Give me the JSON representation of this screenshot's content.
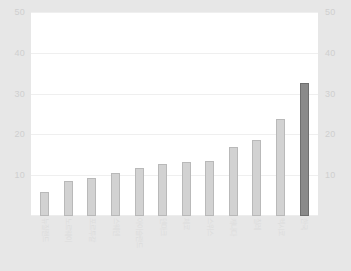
{
  "chart_data": {
    "type": "bar",
    "title": "",
    "xlabel": "",
    "ylabel": "",
    "ylim": [
      0,
      50
    ],
    "grid": true,
    "legend": "none",
    "y_ticks": [
      "10",
      "20",
      "30",
      "40",
      "50"
    ],
    "y_ticks_right": [
      "10",
      "20",
      "30",
      "40",
      "50"
    ],
    "categories": [
      "뉴질랜드",
      "노르웨이",
      "포르투갈",
      "스웨덴",
      "아이슬란드",
      "덴마크",
      "체코",
      "스위스",
      "캐나다",
      "칠레",
      "멕시코",
      "한국"
    ],
    "values": [
      6.0,
      8.5,
      9.3,
      10.5,
      11.8,
      12.7,
      13.3,
      13.5,
      17.0,
      18.7,
      23.8,
      32.5
    ],
    "highlight_index": 11,
    "colors": {
      "bar": "#d2d2d2",
      "bar_border": "#b9b9b9",
      "bar_highlight": "#8a8a8a",
      "bar_highlight_border": "#6f6f6f",
      "plot_background": "#ffffff",
      "page_background": "#e7e7e7",
      "gridline": "#efefef",
      "tick_label": "#cfcfcf"
    }
  }
}
